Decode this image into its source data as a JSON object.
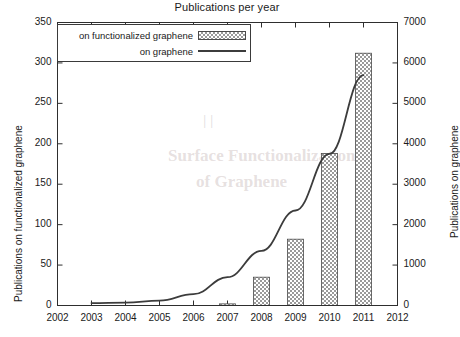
{
  "chart_data": {
    "type": "bar",
    "title": "Publications per year",
    "xlabel": "",
    "ylabel": "Publications on functionalized graphene",
    "y2label": "Publications on graphene",
    "categories": [
      2002,
      2003,
      2004,
      2005,
      2006,
      2007,
      2008,
      2009,
      2010,
      2011,
      2012
    ],
    "xlim": [
      2002,
      2012
    ],
    "xticks": [
      "2002",
      "2003",
      "2004",
      "2005",
      "2006",
      "2007",
      "2008",
      "2009",
      "2010",
      "2011",
      "2012"
    ],
    "ylim": [
      0,
      350
    ],
    "yticks": [
      "0",
      "50",
      "100",
      "150",
      "200",
      "250",
      "300",
      "350"
    ],
    "y2lim": [
      0,
      7000
    ],
    "y2ticks": [
      "0",
      "1000",
      "2000",
      "3000",
      "4000",
      "5000",
      "6000",
      "7000"
    ],
    "grid": false,
    "legend_position": "upper left",
    "series": [
      {
        "name": "on functionalized graphene",
        "type": "bar",
        "axis": "left",
        "x": [
          2003,
          2004,
          2005,
          2006,
          2007,
          2008,
          2009,
          2010,
          2011
        ],
        "values": [
          0,
          0,
          0,
          0,
          2,
          35,
          82,
          188,
          312
        ]
      },
      {
        "name": "on graphene",
        "type": "line",
        "axis": "right",
        "x": [
          2003,
          2004,
          2005,
          2006,
          2007,
          2008,
          2009,
          2010,
          2011
        ],
        "values": [
          60,
          70,
          120,
          280,
          700,
          1350,
          2350,
          3750,
          5700
        ]
      }
    ]
  },
  "legend": {
    "entries": [
      {
        "label": "on functionalized graphene",
        "marker": "hatched-bar-swatch"
      },
      {
        "label": "on graphene",
        "marker": "solid-line-swatch"
      }
    ]
  },
  "ghost_text": {
    "line1": "Surface Functionalization",
    "line2": "of Graphene"
  }
}
